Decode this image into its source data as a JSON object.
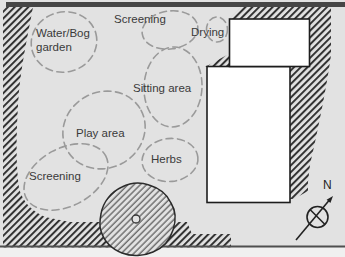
{
  "labels": {
    "water_bog": {
      "line1": "Water/Bog",
      "line2": "garden"
    },
    "screening_top": "Screening",
    "drying": "Drying",
    "sitting_area": "Sitting area",
    "play_area": "Play area",
    "herbs": "Herbs",
    "screening_bottom": "Screening",
    "north": "N"
  },
  "icons": {
    "north_arrow": "compass-north-arrow-icon",
    "tree": "tree-canopy-icon"
  },
  "colors": {
    "background": "#e2e2e2",
    "hatch": "#333333",
    "hatch_fine": "#555555",
    "dashed_outline": "#9a9a9a",
    "building_fill": "#ffffff",
    "building_border": "#1d1d1d",
    "top_bar": "#464646",
    "bottom_line": "#4f4f4f",
    "below_strip": "#f0f0f0",
    "text": "#3a3a3a"
  }
}
